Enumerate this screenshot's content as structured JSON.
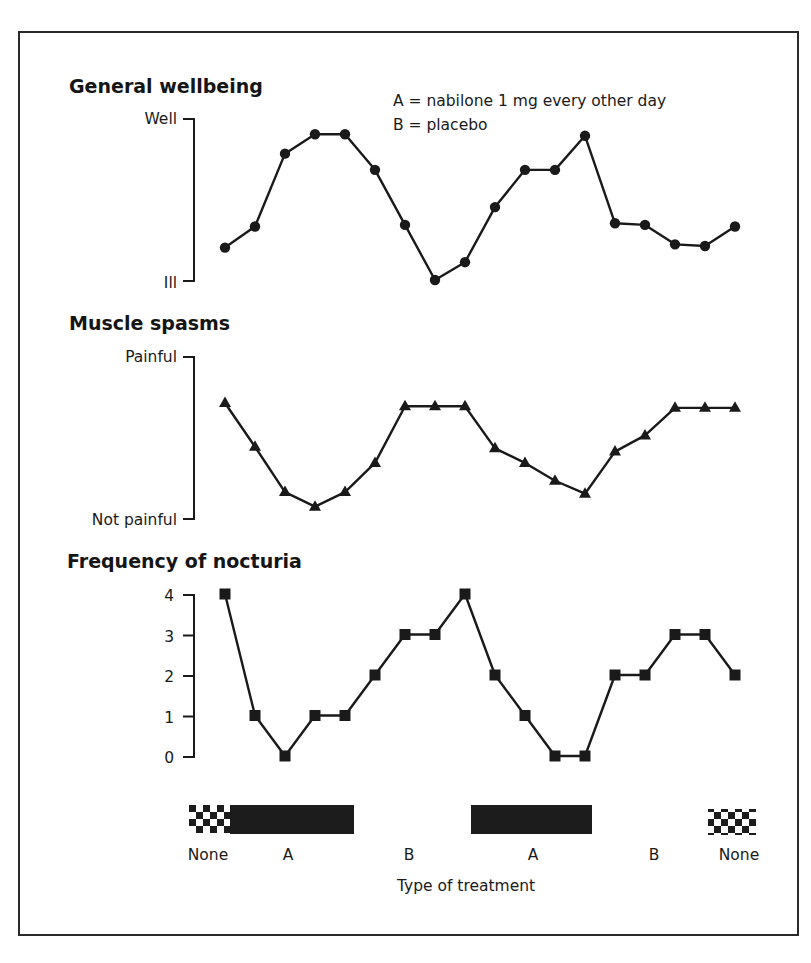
{
  "legend": {
    "line_a": "A = nabilone 1 mg every other day",
    "line_b": "B = placebo"
  },
  "panels": {
    "wellbeing": {
      "title": "General wellbeing",
      "y_top": "Well",
      "y_bottom": "Ill"
    },
    "spasms": {
      "title": "Muscle spasms",
      "y_top": "Painful",
      "y_bottom": "Not painful"
    },
    "nocturia": {
      "title": "Frequency of nocturia",
      "ticks": [
        "0",
        "1",
        "2",
        "3",
        "4"
      ]
    }
  },
  "treatment": {
    "xlabel": "Type of treatment",
    "segments": [
      "None",
      "A",
      "B",
      "A",
      "B",
      "None"
    ]
  },
  "colors": {
    "ink": "#1a1a1a",
    "bar": "#1c1c1c",
    "background": "#ffffff"
  },
  "chart_data": [
    {
      "type": "line",
      "title": "General wellbeing",
      "ylabel": "",
      "y_axis_labels": {
        "top": "Well",
        "bottom": "Ill"
      },
      "ylim": [
        0,
        10
      ],
      "marker": "circle",
      "x": [
        1,
        2,
        3,
        4,
        5,
        6,
        7,
        8,
        9,
        10,
        11,
        12,
        13,
        14,
        15,
        16,
        17,
        18
      ],
      "values": [
        2.0,
        3.3,
        7.8,
        9.0,
        9.0,
        6.8,
        3.4,
        0.0,
        1.1,
        4.5,
        6.8,
        6.8,
        8.9,
        3.5,
        3.4,
        2.2,
        2.1,
        3.3
      ]
    },
    {
      "type": "line",
      "title": "Muscle spasms",
      "ylabel": "",
      "y_axis_labels": {
        "top": "Painful",
        "bottom": "Not painful"
      },
      "ylim": [
        0,
        10
      ],
      "marker": "triangle",
      "x": [
        1,
        2,
        3,
        4,
        5,
        6,
        7,
        8,
        9,
        10,
        11,
        12,
        13,
        14,
        15,
        16,
        17,
        18
      ],
      "values": [
        7.1,
        4.4,
        1.6,
        0.7,
        1.6,
        3.4,
        6.9,
        6.9,
        6.9,
        4.3,
        3.4,
        2.3,
        1.5,
        4.1,
        5.1,
        6.8,
        6.8,
        6.8
      ]
    },
    {
      "type": "line",
      "title": "Frequency of nocturia",
      "ylabel": "",
      "ylim": [
        0,
        4
      ],
      "yticks": [
        0,
        1,
        2,
        3,
        4
      ],
      "marker": "square",
      "x": [
        1,
        2,
        3,
        4,
        5,
        6,
        7,
        8,
        9,
        10,
        11,
        12,
        13,
        14,
        15,
        16,
        17,
        18
      ],
      "values": [
        4,
        1,
        0,
        1,
        1,
        2,
        3,
        3,
        4,
        2,
        1,
        0,
        0,
        2,
        2,
        3,
        3,
        2
      ]
    },
    {
      "type": "table",
      "title": "Treatment periods",
      "xlabel": "Type of treatment",
      "categories": [
        "None",
        "A",
        "B",
        "A",
        "B",
        "None"
      ],
      "legend": [
        "A = nabilone 1 mg every other day",
        "B = placebo"
      ]
    }
  ]
}
